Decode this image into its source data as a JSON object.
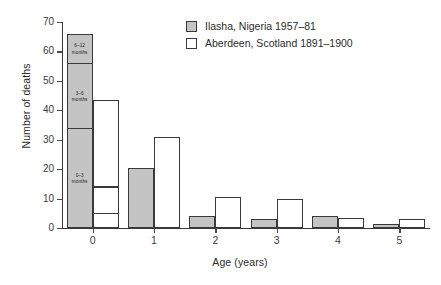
{
  "chart_data": {
    "type": "bar",
    "title": "",
    "subtitle": "",
    "xlabel": "Age (years)",
    "ylabel": "Number of deaths",
    "categories": [
      "0",
      "1",
      "2",
      "3",
      "4",
      "5"
    ],
    "xlim": [
      -0.5,
      5.5
    ],
    "ylim": [
      0,
      70
    ],
    "ytick_labels": [
      "0",
      "10",
      "20",
      "30",
      "40",
      "50",
      "60",
      "70"
    ],
    "ytick_values": [
      0,
      10,
      20,
      30,
      40,
      50,
      60,
      70
    ],
    "grid": false,
    "legend_position": "top-center",
    "series": [
      {
        "name": "Ilasha, Nigeria 1957–81",
        "color": "#c4c4c4",
        "values": [
          66,
          20.5,
          4,
          3,
          4,
          1.5
        ]
      },
      {
        "name": "Aberdeen, Scotland 1891–1900",
        "color": "#ffffff",
        "values": [
          43.5,
          31,
          10.5,
          10,
          3.5,
          3
        ]
      }
    ],
    "stacked_segments": {
      "ilasha_age0": [
        {
          "label": "0–3\nmonths",
          "from": 0,
          "to": 34
        },
        {
          "label": "3–6\nmonths",
          "from": 34,
          "to": 56
        },
        {
          "label": "6–12\nmonths",
          "from": 56,
          "to": 66
        }
      ],
      "aberdeen_age0": [
        {
          "label": "",
          "from": 0,
          "to": 5
        },
        {
          "label": "",
          "from": 5,
          "to": 14
        },
        {
          "label": "",
          "from": 14,
          "to": 43.5
        }
      ]
    },
    "annotations": [
      "0–3 months",
      "3–6 months",
      "6–12 months"
    ]
  },
  "legend": {
    "items": [
      {
        "label": "Ilasha, Nigeria 1957–81",
        "swatch": "gray"
      },
      {
        "label": "Aberdeen, Scotland 1891–1900",
        "swatch": "white"
      }
    ]
  },
  "axes": {
    "y_title": "Number of deaths",
    "x_title": "Age (years)"
  },
  "segment_labels": {
    "top": "6–12\nmonths",
    "middle": "3–6\nmonths",
    "bottom": "0–3\nmonths"
  }
}
